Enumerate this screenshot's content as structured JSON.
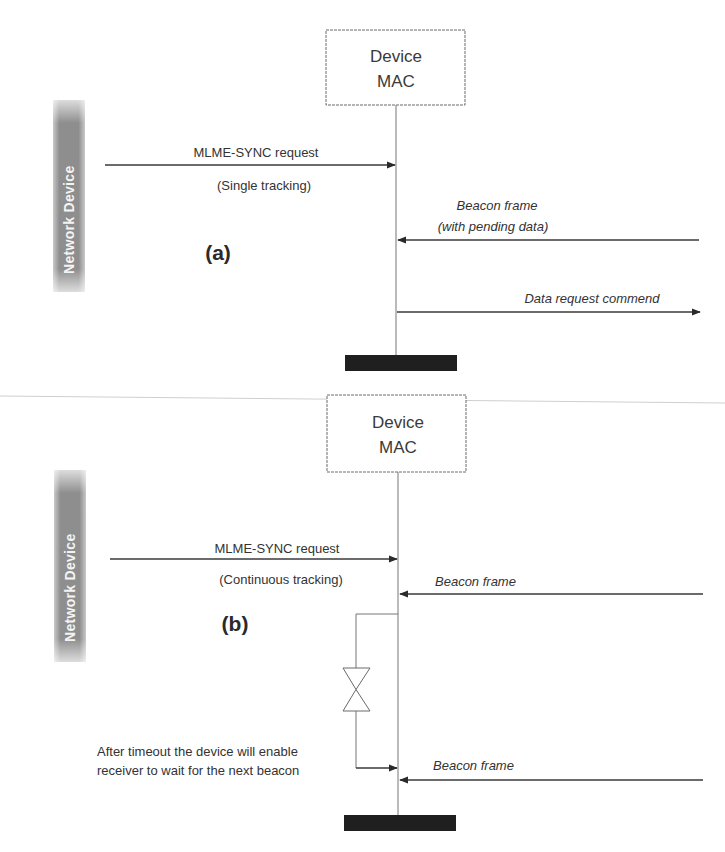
{
  "colors": {
    "line": "#3a3a3a",
    "lifeline": "#777777",
    "box_border": "#6a6a6a",
    "actor_bar": "#8a8a8a",
    "actor_text": "#f4f4f4",
    "terminator": "#1f1f1f",
    "separator": "#cfcfcf"
  },
  "panels": [
    {
      "id": "a",
      "letter": "(a)",
      "actor_label": "Network Device",
      "mac_box": {
        "line1": "Device",
        "line2": "MAC"
      },
      "request": {
        "label": "MLME-SYNC request",
        "sublabel": "(Single tracking)"
      },
      "messages": [
        {
          "label_line1": "Beacon frame",
          "label_line2": "(with pending data)",
          "direction": "incoming"
        },
        {
          "label_line1": "Data request commend",
          "direction": "outgoing"
        }
      ]
    },
    {
      "id": "b",
      "letter": "(b)",
      "actor_label": "Network Device",
      "mac_box": {
        "line1": "Device",
        "line2": "MAC"
      },
      "request": {
        "label": "MLME-SYNC request",
        "sublabel": "(Continuous tracking)"
      },
      "messages": [
        {
          "label_line1": "Beacon frame",
          "direction": "incoming"
        },
        {
          "label_line1": "Beacon frame",
          "direction": "incoming"
        }
      ],
      "timeout_note": {
        "line1": "After timeout the device will enable",
        "line2": "receiver to wait for the next beacon"
      }
    }
  ]
}
